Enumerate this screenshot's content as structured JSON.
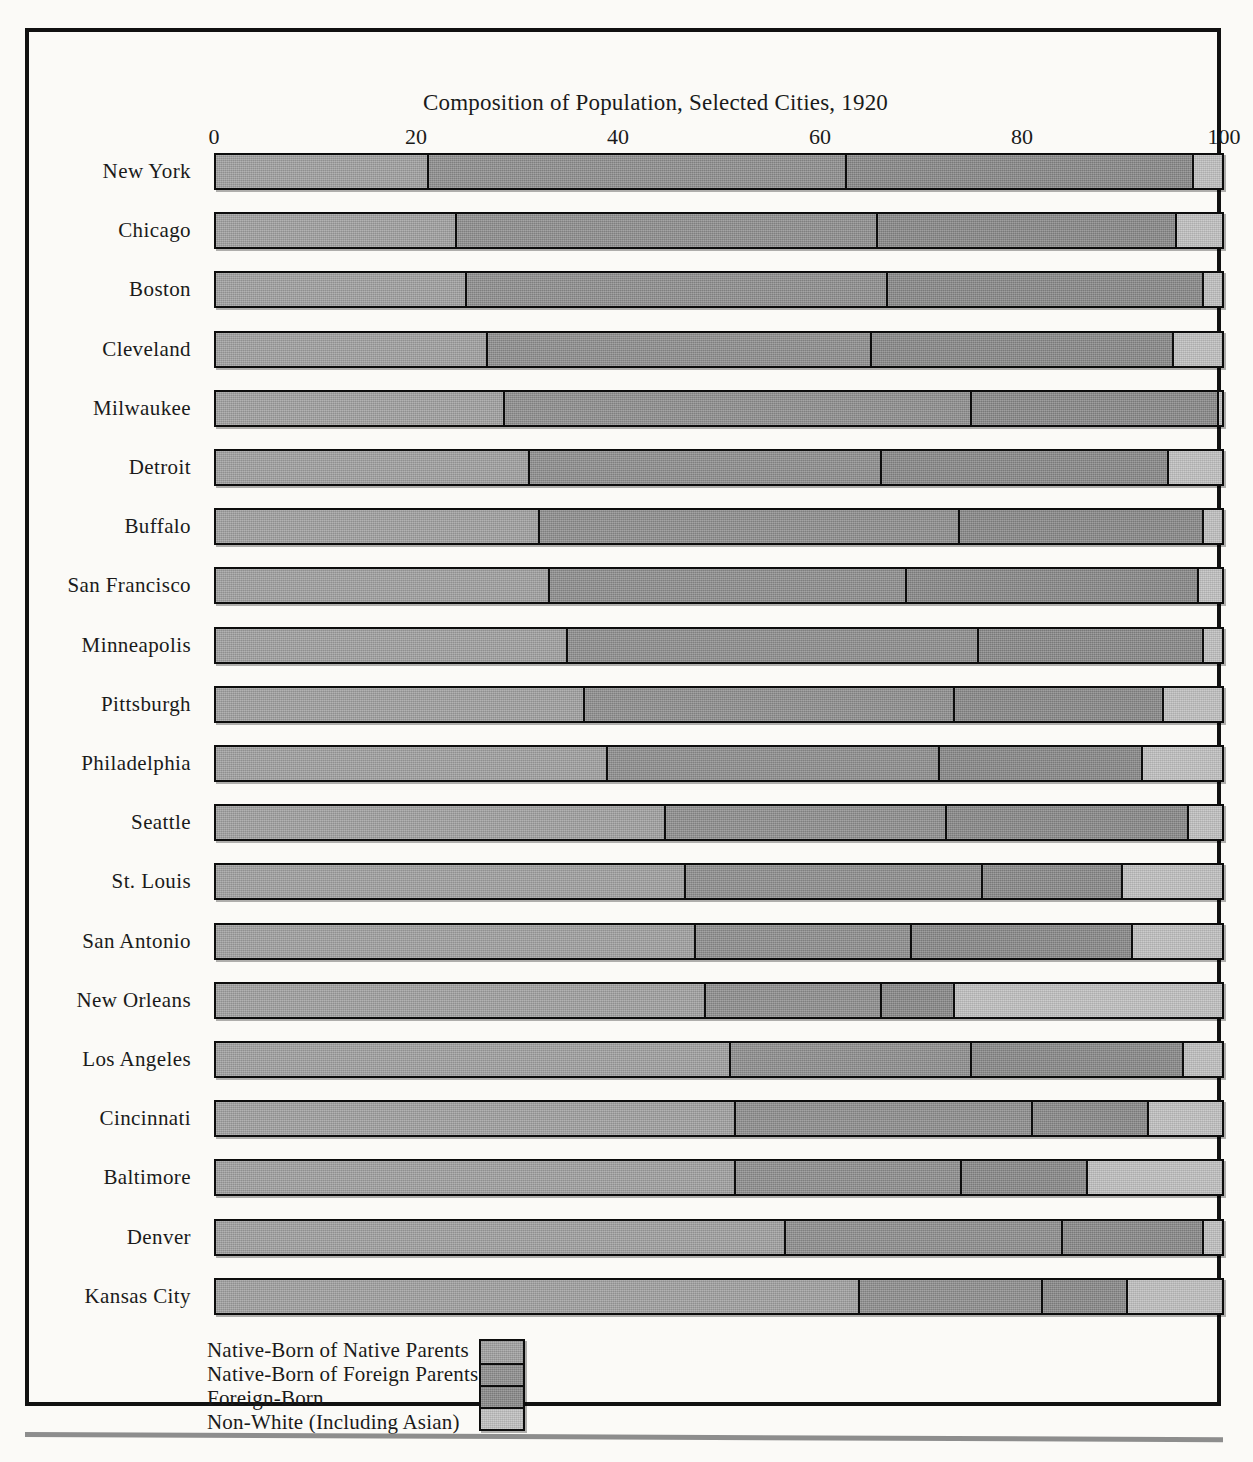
{
  "chart_data": {
    "type": "bar",
    "subtype": "horizontal-stacked-100",
    "title": "Composition of Population, Selected Cities, 1920",
    "xlabel": "",
    "ylabel": "",
    "xlim": [
      0,
      100
    ],
    "xticks": [
      0,
      20,
      40,
      60,
      80,
      100
    ],
    "xtick_labels": [
      "0",
      "20",
      "40",
      "60",
      "80",
      "100"
    ],
    "grid": false,
    "legend_position": "bottom-left",
    "categories": [
      "New York",
      "Chicago",
      "Boston",
      "Cleveland",
      "Milwaukee",
      "Detroit",
      "Buffalo",
      "San Francisco",
      "Minneapolis",
      "Pittsburgh",
      "Philadelphia",
      "Seattle",
      "St. Louis",
      "San Antonio",
      "New Orleans",
      "Los Angeles",
      "Cincinnati",
      "Baltimore",
      "Denver",
      "Kansas City"
    ],
    "series": [
      {
        "name": "Native-Born of Native Parents",
        "color": "#9d9d9d",
        "values": [
          21.0,
          23.8,
          24.8,
          26.8,
          28.5,
          31.0,
          32.0,
          33.0,
          34.8,
          36.5,
          38.8,
          44.5,
          46.5,
          47.5,
          48.5,
          51.0,
          51.5,
          51.5,
          56.5,
          63.8
        ]
      },
      {
        "name": "Native-Born of Foreign Parents",
        "color": "#8b8b8b",
        "values": [
          41.5,
          41.8,
          41.8,
          38.2,
          46.5,
          35.0,
          41.8,
          35.5,
          40.8,
          36.8,
          33.0,
          28.0,
          29.5,
          21.5,
          17.5,
          24.0,
          29.5,
          22.5,
          27.5,
          18.2
        ]
      },
      {
        "name": "Foreign-Born",
        "color": "#858585",
        "values": [
          34.5,
          29.7,
          31.4,
          30.0,
          24.5,
          28.5,
          24.2,
          29.0,
          22.4,
          20.7,
          20.2,
          24.0,
          14.0,
          22.0,
          7.3,
          21.0,
          11.5,
          12.5,
          14.0,
          8.5
        ]
      },
      {
        "name": "Non-White (Including Asian)",
        "color": "#bdbdbd",
        "values": [
          3.0,
          4.7,
          2.0,
          5.0,
          0.5,
          5.5,
          2.0,
          2.5,
          2.0,
          6.0,
          8.0,
          3.5,
          10.0,
          9.0,
          26.7,
          4.0,
          7.5,
          13.5,
          2.0,
          9.5
        ]
      }
    ]
  },
  "legend": {
    "items": [
      {
        "label": "Native-Born of Native Parents",
        "color": "#9d9d9d"
      },
      {
        "label": "Native-Born of Foreign Parents",
        "color": "#8b8b8b"
      },
      {
        "label": "Foreign-Born",
        "color": "#858585"
      },
      {
        "label": "Non-White (Including Asian)",
        "color": "#bdbdbd"
      }
    ]
  }
}
